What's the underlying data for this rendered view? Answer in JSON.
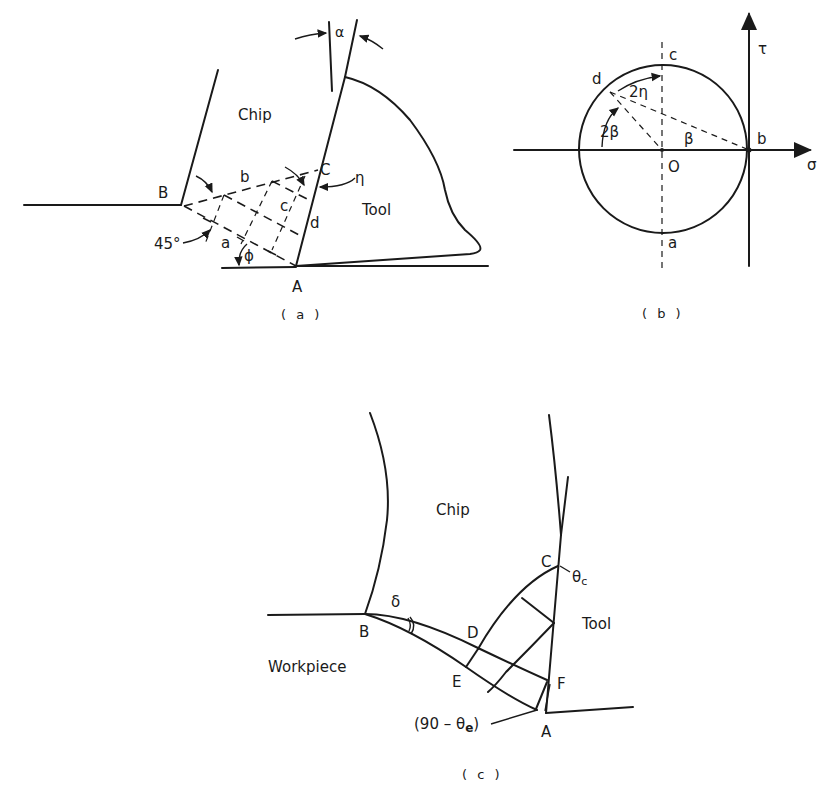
{
  "panel_a": {
    "caption": "( a )",
    "labels": {
      "chip": "Chip",
      "tool": "Tool",
      "B": "B",
      "A": "A",
      "C": "C",
      "b": "b",
      "c": "c",
      "d": "d",
      "a": "a",
      "alpha": "α",
      "eta": "η",
      "phi": "ϕ",
      "angle45": "45°"
    }
  },
  "panel_b": {
    "caption": "( b )",
    "labels": {
      "c": "c",
      "d": "d",
      "b": "b",
      "a": "a",
      "O": "O",
      "two_eta": "2η",
      "two_beta": "2β",
      "beta": "β",
      "sigma": "σ",
      "tau": "τ"
    }
  },
  "panel_c": {
    "caption": "( c )",
    "labels": {
      "chip": "Chip",
      "tool": "Tool",
      "workpiece": "Workpiece",
      "B": "B",
      "C": "C",
      "D": "D",
      "E": "E",
      "F": "F",
      "A": "A",
      "delta": "δ",
      "theta_c": "θ",
      "theta_c_sub": "c",
      "angle_e_prefix": "(90 – θ",
      "angle_e_sub": "e",
      "angle_e_suffix": ")"
    }
  }
}
